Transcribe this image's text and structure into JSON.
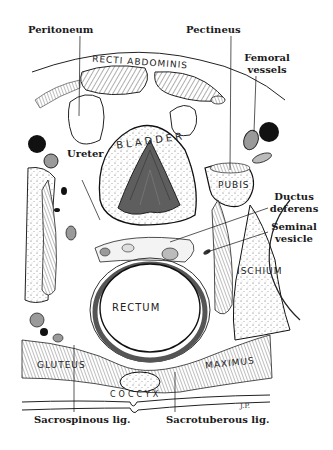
{
  "figure": {
    "signature": "J.P."
  },
  "labels": {
    "peritoneum": "Peritoneum",
    "pectineus": "Pectineus",
    "femoral_line1": "Femoral",
    "femoral_line2": "vessels",
    "ureter": "Ureter",
    "ductus_line1": "Ductus",
    "ductus_line2": "deferens",
    "seminal_line1": "Seminal",
    "seminal_line2": "vesicle",
    "sacrospinous": "Sacrospinous lig.",
    "sacrotuberous": "Sacrotuberous lig."
  },
  "structure_labels": {
    "recti_abdominis": "RECTI ABDOMINIS",
    "bladder": "BLADDER",
    "pubis": "PUBIS",
    "ischium": "ISCHIUM",
    "rectum": "RECTUM",
    "gluteus": "GLUTEUS",
    "maximus": "MAXIMUS",
    "coccyx": "COCCYX"
  },
  "colors": {
    "ink": "#1a1a1a",
    "mucosa": "#6b6b6b",
    "vessel_dark": "#111111",
    "vessel_gray": "#9a9a9a",
    "stipple_bg": "#f4f4f4",
    "paper": "#ffffff"
  }
}
